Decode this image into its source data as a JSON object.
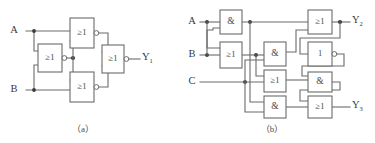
{
  "figure": {
    "background_color": "#ffffff",
    "line_color": "#6b6b6b",
    "text_color": "#3a3a3a"
  },
  "captions": {
    "a": "（a）",
    "b": "（b）"
  },
  "circuit_a": {
    "name": "circuit-a",
    "inputs": [
      {
        "label": "A",
        "x": 16,
        "y": 31
      },
      {
        "label": "B",
        "x": 16,
        "y": 90
      }
    ],
    "outputs": [
      {
        "label": "Y",
        "sub": "1",
        "x": 142,
        "y": 60
      }
    ],
    "gates": [
      {
        "id": "a-g1",
        "symbol": "≥1",
        "type": "nor",
        "x": 70,
        "y": 18,
        "w": 24,
        "h": 30,
        "bubble": true
      },
      {
        "id": "a-g2",
        "symbol": "≥1",
        "type": "nor",
        "x": 38,
        "y": 44,
        "w": 24,
        "h": 28,
        "bubble": true
      },
      {
        "id": "a-g3",
        "symbol": "≥1",
        "type": "nor",
        "x": 70,
        "y": 72,
        "w": 24,
        "h": 30,
        "bubble": true
      },
      {
        "id": "a-g4",
        "symbol": "≥1",
        "type": "nor",
        "x": 102,
        "y": 45,
        "w": 22,
        "h": 28,
        "bubble": true
      }
    ]
  },
  "circuit_b": {
    "name": "circuit-b",
    "inputs": [
      {
        "label": "A",
        "x": 192,
        "y": 22
      },
      {
        "label": "B",
        "x": 192,
        "y": 55
      },
      {
        "label": "C",
        "x": 192,
        "y": 82
      }
    ],
    "outputs": [
      {
        "label": "Y",
        "sub": "2",
        "x": 352,
        "y": 22
      },
      {
        "label": "Y",
        "sub": "3",
        "x": 352,
        "y": 105
      }
    ],
    "gates": [
      {
        "id": "b-g1",
        "symbol": "&",
        "type": "and",
        "x": 220,
        "y": 10,
        "w": 22,
        "h": 24,
        "bubble": false
      },
      {
        "id": "b-g2",
        "symbol": "≥1",
        "type": "or",
        "x": 220,
        "y": 42,
        "w": 22,
        "h": 26,
        "bubble": false
      },
      {
        "id": "b-g3",
        "symbol": "&",
        "type": "and",
        "x": 264,
        "y": 42,
        "w": 22,
        "h": 24,
        "bubble": false
      },
      {
        "id": "b-g4",
        "symbol": "≥1",
        "type": "or",
        "x": 264,
        "y": 70,
        "w": 22,
        "h": 22,
        "bubble": false
      },
      {
        "id": "b-g5",
        "symbol": "&",
        "type": "and",
        "x": 264,
        "y": 96,
        "w": 22,
        "h": 22,
        "bubble": false
      },
      {
        "id": "b-g6",
        "symbol": "≥1",
        "type": "or",
        "x": 308,
        "y": 10,
        "w": 24,
        "h": 24,
        "bubble": false
      },
      {
        "id": "b-g7",
        "symbol": "1",
        "type": "not",
        "x": 308,
        "y": 42,
        "w": 24,
        "h": 24,
        "bubble": true
      },
      {
        "id": "b-g8",
        "symbol": "&",
        "type": "and",
        "x": 308,
        "y": 72,
        "w": 24,
        "h": 20,
        "bubble": false
      },
      {
        "id": "b-g9",
        "symbol": "≥1",
        "type": "or",
        "x": 308,
        "y": 96,
        "w": 24,
        "h": 22,
        "bubble": false
      }
    ]
  }
}
